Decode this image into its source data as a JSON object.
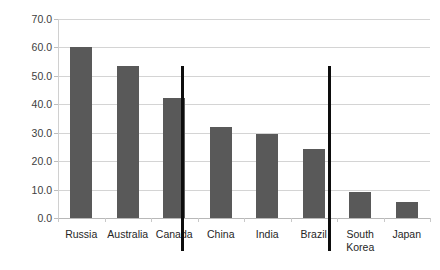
{
  "chart_data": {
    "type": "bar",
    "title": "",
    "subtitle": "",
    "xlabel": "",
    "ylabel": "",
    "categories": [
      "Russia",
      "Australia",
      "Canada",
      "China",
      "India",
      "Brazil",
      "South Korea",
      "Japan"
    ],
    "values": [
      60.3,
      53.3,
      42.3,
      32.0,
      29.5,
      24.3,
      9.3,
      5.6
    ],
    "series": [
      {
        "name": "",
        "values": [
          60.3,
          53.3,
          42.3,
          32.0,
          29.5,
          24.3,
          9.3,
          5.6
        ]
      }
    ],
    "ylim": [
      0.0,
      70.0
    ],
    "ytick_values": [
      0.0,
      10.0,
      20.0,
      30.0,
      40.0,
      50.0,
      60.0,
      70.0
    ],
    "ytick_labels": [
      "0.0",
      "10.0",
      "20.0",
      "30.0",
      "40.0",
      "50.0",
      "60.0",
      "70.0"
    ],
    "grid": true,
    "grid_axis": "y",
    "legend": false,
    "legend_position": "none",
    "bar_color": "#595959",
    "gridline_color": "#d4d4d4",
    "axis_color": "#b8b8b8",
    "background_color": "#ffffff",
    "annotations": [
      {
        "name": "group-divider-1",
        "type": "vertical-line",
        "color": "#0d0d0d",
        "after_category": "Canada"
      },
      {
        "name": "group-divider-2",
        "type": "vertical-line",
        "color": "#0d0d0d",
        "after_category": "Brazil"
      }
    ]
  },
  "axis": {
    "y_labels": [
      "70.0",
      "60.0",
      "50.0",
      "40.0",
      "30.0",
      "20.0",
      "10.0",
      "0.0"
    ],
    "x_labels": [
      "Russia",
      "Australia",
      "Canada",
      "China",
      "India",
      "Brazil",
      "South\nKorea",
      "Japan"
    ]
  }
}
